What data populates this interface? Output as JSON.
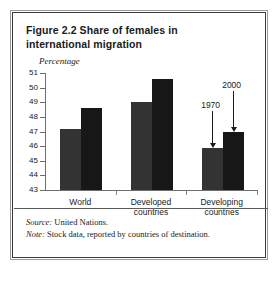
{
  "figure": {
    "title": "Figure 2.2  Share of females in international migration",
    "source_label": "Source:",
    "source_value": " United Nations.",
    "note_label": "Note:",
    "note_value": " Stock data, reported by countries of destination."
  },
  "annotations": {
    "first": "1970",
    "second": "2000"
  },
  "colors": {
    "bar_1970": "#333333",
    "bar_2000": "#171717",
    "frame": "#3a3a3a",
    "axis": "#6e6e6e"
  },
  "chart_data": {
    "type": "bar",
    "title": "Figure 2.2  Share of females in international migration",
    "subtitle": "",
    "xlabel": "",
    "ylabel": "Percentage",
    "ylim": [
      43,
      51
    ],
    "yticks": [
      43,
      44,
      45,
      46,
      47,
      48,
      49,
      50,
      51
    ],
    "ytick_labels": [
      "43",
      "44",
      "45",
      "46",
      "47",
      "48",
      "49",
      "50",
      "51"
    ],
    "grid": false,
    "legend_position": "none",
    "categories": [
      "World",
      "Developed countries",
      "Developing countries"
    ],
    "series": [
      {
        "name": "1970",
        "values": [
          47.2,
          49.0,
          45.9
        ]
      },
      {
        "name": "2000",
        "values": [
          48.6,
          50.6,
          47.0
        ]
      }
    ],
    "annotations": [
      {
        "text": "1970",
        "points_to_series": "1970",
        "points_to_category": "Developing countries"
      },
      {
        "text": "2000",
        "points_to_series": "2000",
        "points_to_category": "Developing countries"
      }
    ]
  }
}
